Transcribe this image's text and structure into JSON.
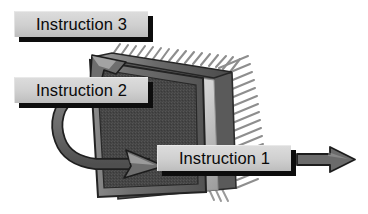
{
  "figure": {
    "kind": "technical-illustration",
    "background_color": "#ffffff",
    "palette": {
      "plaque_face": "#cfcfcf",
      "plaque_shadow": "#0d0d0d",
      "plaque_text": "#0a0a0a",
      "chip_die": "#4d4d4d",
      "chip_body_front": "#6e6e6e",
      "chip_body_edge": "#2e2e2e",
      "chip_rim_highlight": "#e0e0e0",
      "pin_color": "#8a8a8a",
      "arrow_color": "#636363",
      "arrow_outline": "#2b2b2b"
    }
  },
  "labels": {
    "instruction_3": "Instruction 3",
    "instruction_2": "Instruction 2",
    "instruction_1": "Instruction 1"
  },
  "icons": {
    "chip": "processor-chip-icon",
    "pins": "chip-pins-icon",
    "arrow_out": "arrow-right-icon",
    "arrow_in_top": "arrow-upleft-icon",
    "arrow_in_middle": "arrow-right-icon"
  },
  "flows": [
    {
      "name": "instruction-1-flow",
      "label": "Instruction 1",
      "direction": "out-right",
      "description": "Instruction 1 exits the chip to the right"
    },
    {
      "name": "instruction-2-flow",
      "label": "Instruction 2",
      "direction": "into-chip-right",
      "description": "Instruction 2 curves down and enters the chip pointing right"
    },
    {
      "name": "instruction-3-flow",
      "label": "Instruction 3",
      "direction": "into-chip-upleft",
      "description": "Instruction 3 enters at the top of the chip pointing up-left"
    }
  ]
}
